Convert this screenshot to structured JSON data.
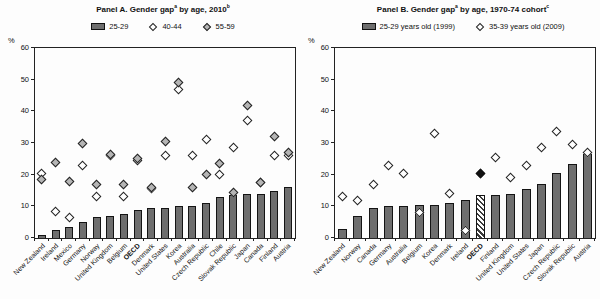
{
  "y_unit": "%",
  "colors": {
    "background": "#fdfdfd",
    "bar_fill": "#6e6e6e",
    "bar_border": "#141414",
    "diamond_open_fill": "#ffffff",
    "diamond_shaded_fill": "#b5b5b5",
    "diamond_black_fill": "#111111",
    "axis": "#222222",
    "text": "#111111"
  },
  "chart_data": [
    {
      "id": "panel-a",
      "type": "bar",
      "title_parts": [
        {
          "t": "Panel A. Gender gap"
        },
        {
          "t": "a",
          "sup": true
        },
        {
          "t": " by age, 2010"
        },
        {
          "t": "b",
          "sup": true
        }
      ],
      "legend": [
        {
          "label": "25-29",
          "marker": "bar"
        },
        {
          "label": "40-44",
          "marker": "diamond-open"
        },
        {
          "label": "55-59",
          "marker": "diamond-shaded"
        }
      ],
      "categories": [
        "New Zealand",
        "Ireland",
        "Mexico",
        "Germany",
        "Norway",
        "United Kingdom",
        "Belgium",
        "OECD",
        "Denmark",
        "United States",
        "Korea",
        "Australia",
        "Czech Republic",
        "Chile",
        "Slovak Republic",
        "Japan",
        "Canada",
        "Finland",
        "Austria"
      ],
      "bold_category": "OECD",
      "series": [
        {
          "name": "25-29",
          "marker": "bar",
          "values": [
            1,
            2.5,
            3.5,
            5,
            6.5,
            7,
            7.5,
            9,
            9.5,
            9.5,
            10,
            10,
            11,
            13,
            13.5,
            14,
            14,
            15,
            16
          ]
        },
        {
          "name": "40-44",
          "marker": "diamond-open",
          "values": [
            20.5,
            8.5,
            6.5,
            23,
            13,
            26,
            13,
            24.5,
            15.5,
            26,
            47,
            26,
            31,
            20,
            28.5,
            37,
            17.5,
            26,
            26
          ]
        },
        {
          "name": "55-59",
          "marker": "diamond-shaded",
          "values": [
            18.5,
            24,
            18,
            30,
            17,
            26.5,
            17,
            25,
            16,
            30.5,
            49,
            16,
            20,
            23.5,
            14.5,
            42,
            17.5,
            32,
            27
          ]
        }
      ],
      "ylim": [
        0,
        60
      ],
      "ytick_step": 10,
      "grid": false,
      "legend_position": "top",
      "special": {}
    },
    {
      "id": "panel-b",
      "type": "bar",
      "title_parts": [
        {
          "t": "Panel B. Gender gap"
        },
        {
          "t": "a",
          "sup": true
        },
        {
          "t": " by age, 1970-74 cohort"
        },
        {
          "t": "c",
          "sup": true
        }
      ],
      "legend": [
        {
          "label": "25-29 years old (1999)",
          "marker": "bar"
        },
        {
          "label": "35-39 years old (2009)",
          "marker": "diamond-open"
        }
      ],
      "categories": [
        "New Zealand",
        "Norway",
        "Canada",
        "Germany",
        "Australia",
        "Belgium",
        "Korea",
        "Denmark",
        "Ireland",
        "OECD",
        "Finland",
        "United Kingdom",
        "United States",
        "Japan",
        "Czech Republic",
        "Slovak Republic",
        "Austria"
      ],
      "bold_category": "OECD",
      "series": [
        {
          "name": "25-29 years old (1999)",
          "marker": "bar",
          "values": [
            3,
            7,
            9.5,
            10,
            10,
            10.5,
            10.5,
            11,
            12,
            13.5,
            13.5,
            14,
            15.5,
            17,
            20.5,
            23.5,
            26.5
          ]
        },
        {
          "name": "35-39 years old (2009)",
          "marker": "diamond-open",
          "values": [
            13,
            12,
            17,
            23,
            20.5,
            8,
            33,
            14,
            2.5,
            20.5,
            25.5,
            19,
            23,
            28.5,
            33.5,
            29.5,
            27
          ]
        }
      ],
      "ylim": [
        0,
        60
      ],
      "ytick_step": 10,
      "grid": false,
      "legend_position": "top",
      "special": {
        "hatched_bar_category": "OECD",
        "black_diamond_category": "OECD"
      }
    }
  ]
}
